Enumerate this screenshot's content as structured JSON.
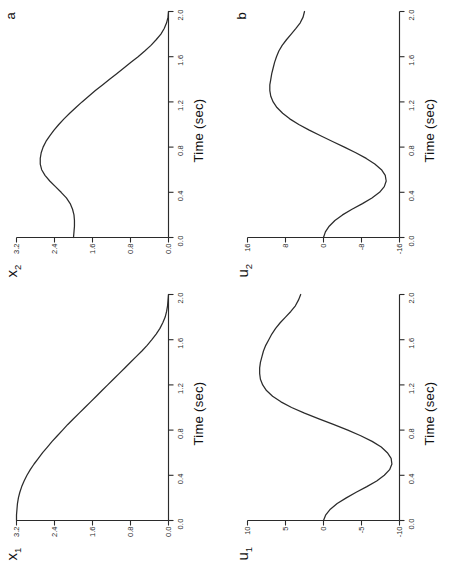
{
  "figure": {
    "background": "#ffffff",
    "ink": "#2b2b2b",
    "orientation": "rotated-90-ccw",
    "panel_letters": {
      "a": "a",
      "b": "b"
    }
  },
  "axis": {
    "time_label": "Time (sec)",
    "time_ticks": [
      "0.0",
      "0.4",
      "0.8",
      "1.2",
      "1.6",
      "2.0"
    ],
    "time_min": 0.0,
    "time_max": 2.0
  },
  "chart_data": [
    {
      "id": "x2",
      "type": "line",
      "title": "",
      "panel_letter": "a",
      "ylabel": "x",
      "ylabel_sub": "2",
      "ylabel_display": "x₂",
      "xlabel": "Time (sec)",
      "xlim": [
        0.0,
        2.0
      ],
      "ylim": [
        0.0,
        3.2
      ],
      "xticks": [
        "0.0",
        "0.4",
        "0.8",
        "1.2",
        "1.6",
        "2.0"
      ],
      "yticks": [
        "3.2",
        "2.4",
        "1.6",
        "0.8",
        "0.0"
      ],
      "ytick_values": [
        3.2,
        2.4,
        1.6,
        0.8,
        0.0
      ],
      "grid": false,
      "legend": "none",
      "x": [
        0.0,
        0.05,
        0.1,
        0.15,
        0.2,
        0.25,
        0.3,
        0.35,
        0.4,
        0.45,
        0.5,
        0.55,
        0.6,
        0.65,
        0.7,
        0.75,
        0.8,
        0.85,
        0.9,
        0.95,
        1.0,
        1.05,
        1.1,
        1.15,
        1.2,
        1.25,
        1.3,
        1.35,
        1.4,
        1.45,
        1.5,
        1.55,
        1.6,
        1.65,
        1.7,
        1.75,
        1.8,
        1.85,
        1.9,
        1.95,
        2.0
      ],
      "y": [
        2.0,
        1.99,
        1.98,
        1.98,
        1.99,
        2.02,
        2.07,
        2.15,
        2.26,
        2.38,
        2.5,
        2.6,
        2.67,
        2.7,
        2.7,
        2.68,
        2.64,
        2.58,
        2.5,
        2.41,
        2.31,
        2.2,
        2.08,
        1.95,
        1.82,
        1.68,
        1.54,
        1.39,
        1.24,
        1.09,
        0.94,
        0.79,
        0.64,
        0.5,
        0.37,
        0.26,
        0.16,
        0.09,
        0.04,
        0.01,
        0.0
      ]
    },
    {
      "id": "u2",
      "type": "line",
      "title": "",
      "panel_letter": "b",
      "ylabel": "u",
      "ylabel_sub": "2",
      "ylabel_display": "u₂",
      "xlabel": "Time (sec)",
      "xlim": [
        0.0,
        2.0
      ],
      "ylim": [
        -16,
        16
      ],
      "xticks": [
        "0.0",
        "0.4",
        "0.8",
        "1.2",
        "1.6",
        "2.0"
      ],
      "yticks": [
        "16",
        "8",
        "0",
        "-8",
        "-16"
      ],
      "ytick_values": [
        16,
        8,
        0,
        -8,
        -16
      ],
      "grid": false,
      "legend": "none",
      "x": [
        0.0,
        0.05,
        0.1,
        0.15,
        0.2,
        0.25,
        0.3,
        0.35,
        0.4,
        0.45,
        0.5,
        0.55,
        0.6,
        0.65,
        0.7,
        0.75,
        0.8,
        0.85,
        0.9,
        0.95,
        1.0,
        1.05,
        1.1,
        1.15,
        1.2,
        1.25,
        1.3,
        1.35,
        1.4,
        1.45,
        1.5,
        1.55,
        1.6,
        1.65,
        1.7,
        1.75,
        1.8,
        1.85,
        1.9,
        1.95,
        2.0
      ],
      "y": [
        0.0,
        -0.4,
        -1.2,
        -2.4,
        -4.0,
        -6.0,
        -8.2,
        -10.2,
        -11.8,
        -12.8,
        -13.2,
        -13.0,
        -12.2,
        -10.8,
        -9.0,
        -6.8,
        -4.4,
        -1.9,
        0.6,
        3.0,
        5.2,
        7.1,
        8.6,
        9.8,
        10.6,
        11.1,
        11.3,
        11.3,
        11.1,
        10.9,
        10.6,
        10.3,
        9.9,
        9.4,
        8.7,
        7.8,
        6.8,
        5.8,
        4.9,
        4.3,
        4.0
      ]
    },
    {
      "id": "x1",
      "type": "line",
      "title": "",
      "panel_letter": "",
      "ylabel": "x",
      "ylabel_sub": "1",
      "ylabel_display": "x₁",
      "xlabel": "Time (sec)",
      "xlim": [
        0.0,
        2.0
      ],
      "ylim": [
        0.0,
        3.2
      ],
      "xticks": [
        "0.0",
        "0.4",
        "0.8",
        "1.2",
        "1.6",
        "2.0"
      ],
      "yticks": [
        "3.2",
        "2.4",
        "1.6",
        "0.8",
        "0.0"
      ],
      "ytick_values": [
        3.2,
        2.4,
        1.6,
        0.8,
        0.0
      ],
      "grid": false,
      "legend": "none",
      "x": [
        0.0,
        0.05,
        0.1,
        0.15,
        0.2,
        0.25,
        0.3,
        0.35,
        0.4,
        0.45,
        0.5,
        0.55,
        0.6,
        0.65,
        0.7,
        0.75,
        0.8,
        0.85,
        0.9,
        0.95,
        1.0,
        1.05,
        1.1,
        1.15,
        1.2,
        1.25,
        1.3,
        1.35,
        1.4,
        1.45,
        1.5,
        1.55,
        1.6,
        1.65,
        1.7,
        1.75,
        1.8,
        1.85,
        1.9,
        1.95,
        2.0
      ],
      "y": [
        3.2,
        3.2,
        3.19,
        3.18,
        3.16,
        3.13,
        3.09,
        3.04,
        2.98,
        2.91,
        2.83,
        2.74,
        2.65,
        2.55,
        2.45,
        2.34,
        2.23,
        2.12,
        2.0,
        1.88,
        1.76,
        1.64,
        1.52,
        1.4,
        1.28,
        1.16,
        1.04,
        0.92,
        0.8,
        0.68,
        0.56,
        0.45,
        0.35,
        0.26,
        0.18,
        0.12,
        0.07,
        0.04,
        0.02,
        0.01,
        0.0
      ]
    },
    {
      "id": "u1",
      "type": "line",
      "title": "",
      "panel_letter": "",
      "ylabel": "u",
      "ylabel_sub": "1",
      "ylabel_display": "u₁",
      "xlabel": "Time (sec)",
      "xlim": [
        0.0,
        2.0
      ],
      "ylim": [
        -10,
        10
      ],
      "xticks": [
        "0.0",
        "0.4",
        "0.8",
        "1.2",
        "1.6",
        "2.0"
      ],
      "yticks": [
        "10",
        "5",
        "0",
        "-5",
        "-10"
      ],
      "ytick_values": [
        10,
        5,
        0,
        -5,
        -10
      ],
      "grid": false,
      "legend": "none",
      "x": [
        0.0,
        0.05,
        0.1,
        0.15,
        0.2,
        0.25,
        0.3,
        0.35,
        0.4,
        0.45,
        0.5,
        0.55,
        0.6,
        0.65,
        0.7,
        0.75,
        0.8,
        0.85,
        0.9,
        0.95,
        1.0,
        1.05,
        1.1,
        1.15,
        1.2,
        1.25,
        1.3,
        1.35,
        1.4,
        1.45,
        1.5,
        1.55,
        1.6,
        1.65,
        1.7,
        1.75,
        1.8,
        1.85,
        1.9,
        1.95,
        2.0
      ],
      "y": [
        0.0,
        -0.3,
        -0.9,
        -1.8,
        -3.0,
        -4.3,
        -5.7,
        -7.0,
        -8.0,
        -8.7,
        -9.0,
        -8.9,
        -8.4,
        -7.6,
        -6.4,
        -4.9,
        -3.2,
        -1.3,
        0.6,
        2.5,
        4.2,
        5.6,
        6.7,
        7.5,
        8.0,
        8.3,
        8.4,
        8.4,
        8.3,
        8.1,
        7.9,
        7.6,
        7.2,
        6.8,
        6.3,
        5.7,
        5.0,
        4.3,
        3.7,
        3.3,
        3.0
      ]
    }
  ]
}
